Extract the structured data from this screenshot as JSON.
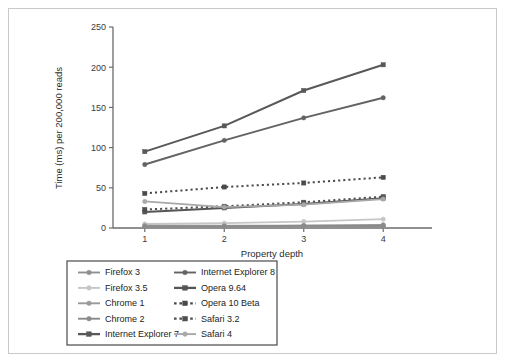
{
  "chart_data": {
    "type": "line",
    "title": "",
    "xlabel": "Property depth",
    "ylabel": "Time (ms) per 200,000 reads",
    "x": [
      1,
      2,
      3,
      4
    ],
    "xticklabels": [
      "1",
      "2",
      "3",
      "4"
    ],
    "yticklabels": [
      "0",
      "50",
      "100",
      "150",
      "200",
      "250"
    ],
    "yticks": [
      0,
      50,
      100,
      150,
      200,
      250
    ],
    "ylim": [
      0,
      250
    ],
    "xlim": [
      0.6,
      4.4
    ],
    "grid": false,
    "legend_position": "below-plot",
    "legend_columns": 2,
    "series": [
      {
        "name": "Firefox 3",
        "values": [
          2,
          2,
          2,
          2
        ],
        "color": "#8f8f8f",
        "marker": "circle",
        "dash": "solid",
        "width": 1.6
      },
      {
        "name": "Firefox 3.5",
        "values": [
          5,
          6,
          8,
          11
        ],
        "color": "#c6c6c6",
        "marker": "circle",
        "dash": "solid",
        "width": 1.8
      },
      {
        "name": "Chrome 1",
        "values": [
          3,
          3,
          3,
          4
        ],
        "color": "#9a9a9a",
        "marker": "circle",
        "dash": "solid",
        "width": 1.6
      },
      {
        "name": "Chrome 2",
        "values": [
          2,
          2,
          3,
          3
        ],
        "color": "#8a8a8a",
        "marker": "circle",
        "dash": "solid",
        "width": 1.6
      },
      {
        "name": "Internet Explorer 7",
        "values": [
          95,
          127,
          171,
          203
        ],
        "color": "#585858",
        "marker": "square",
        "dash": "solid",
        "width": 2.0
      },
      {
        "name": "Internet Explorer 8",
        "values": [
          79,
          109,
          137,
          162
        ],
        "color": "#636363",
        "marker": "circle",
        "dash": "solid",
        "width": 2.0
      },
      {
        "name": "Opera 9.64",
        "values": [
          20,
          25,
          30,
          37
        ],
        "color": "#555555",
        "marker": "square",
        "dash": "solid",
        "width": 2.0
      },
      {
        "name": "Opera 10 Beta",
        "values": [
          43,
          51,
          56,
          63
        ],
        "color": "#4a4a4a",
        "marker": "square",
        "dash": "dotted",
        "width": 2.0
      },
      {
        "name": "Safari 3.2",
        "values": [
          23,
          27,
          32,
          39
        ],
        "color": "#4f4f4f",
        "marker": "square",
        "dash": "dotted",
        "width": 2.0
      },
      {
        "name": "Safari 4",
        "values": [
          33,
          26,
          29,
          36
        ],
        "color": "#a8a8a8",
        "marker": "circle",
        "dash": "solid",
        "width": 1.8
      }
    ]
  },
  "legend": {
    "columns": [
      {
        "entries": [
          {
            "label": "Firefox 3",
            "color": "#8f8f8f",
            "marker": "circle",
            "dash": "solid"
          },
          {
            "label": "Firefox 3.5",
            "color": "#c6c6c6",
            "marker": "circle",
            "dash": "solid"
          },
          {
            "label": "Chrome 1",
            "color": "#9a9a9a",
            "marker": "circle",
            "dash": "solid"
          },
          {
            "label": "Chrome 2",
            "color": "#8a8a8a",
            "marker": "circle",
            "dash": "solid"
          },
          {
            "label": "Internet Explorer 7",
            "color": "#585858",
            "marker": "square",
            "dash": "solid"
          }
        ]
      },
      {
        "entries": [
          {
            "label": "Internet Explorer 8",
            "color": "#636363",
            "marker": "circle",
            "dash": "solid"
          },
          {
            "label": "Opera 9.64",
            "color": "#555555",
            "marker": "square",
            "dash": "solid"
          },
          {
            "label": "Opera 10 Beta",
            "color": "#4a4a4a",
            "marker": "square",
            "dash": "dotted"
          },
          {
            "label": "Safari 3.2",
            "color": "#4f4f4f",
            "marker": "square",
            "dash": "dotted"
          },
          {
            "label": "Safari 4",
            "color": "#a8a8a8",
            "marker": "circle",
            "dash": "solid"
          }
        ]
      }
    ]
  },
  "style": {
    "axis_color": "#6b6b6b",
    "frame_color": "#c9c9c9",
    "background": "#ffffff",
    "legend_border": "#4a4a4a"
  }
}
